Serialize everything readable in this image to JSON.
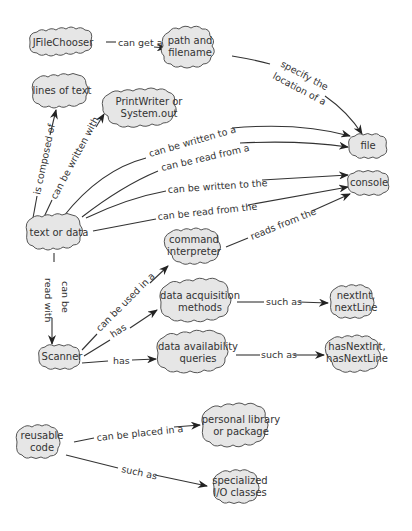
{
  "diagram": {
    "type": "concept-map",
    "colors": {
      "node_fill": "#e6e6e6",
      "node_stroke": "#555555",
      "edge": "#333333",
      "text": "#333333"
    },
    "nodes": [
      {
        "id": "jfilechooser",
        "label": "JFileChooser",
        "x": 63,
        "y": 43,
        "w": 72,
        "h": 26
      },
      {
        "id": "path",
        "label": "path and\nfilename",
        "x": 192,
        "y": 47,
        "w": 62,
        "h": 38
      },
      {
        "id": "lines",
        "label": "lines of text",
        "x": 64,
        "y": 92,
        "w": 64,
        "h": 30
      },
      {
        "id": "printwriter",
        "label": "PrintWriter or\nSystem.out",
        "x": 148,
        "y": 108,
        "w": 90,
        "h": 36
      },
      {
        "id": "file",
        "label": "file",
        "x": 169,
        "y": 146,
        "w": 40,
        "h": 22,
        "absx": 369
      },
      {
        "id": "console",
        "label": "console",
        "x": 369,
        "y": 183,
        "w": 42,
        "h": 22
      },
      {
        "id": "textdata",
        "label": "text or data",
        "x": 59,
        "y": 233,
        "w": 66,
        "h": 36
      },
      {
        "id": "command",
        "label": "command\ninterpreter",
        "x": 216,
        "y": 246,
        "w": 64,
        "h": 36
      },
      {
        "id": "acquisition",
        "label": "data acquisition\nmethods",
        "x": 233,
        "y": 302,
        "w": 88,
        "h": 44
      },
      {
        "id": "scanner",
        "label": "Scanner",
        "x": 59,
        "y": 357,
        "w": 42,
        "h": 22
      },
      {
        "id": "availability",
        "label": "data availability\nqueries",
        "x": 231,
        "y": 353,
        "w": 92,
        "h": 42
      },
      {
        "id": "nextint",
        "label": "nextInt,\nnextLine",
        "x": 358,
        "y": 302,
        "w": 56,
        "h": 36
      },
      {
        "id": "hasnextint",
        "label": "hasNextInt,\nhasNextLine",
        "x": 358,
        "y": 353,
        "w": 66,
        "h": 38
      },
      {
        "id": "reusable",
        "label": "reusable\ncode",
        "x": 44,
        "y": 442,
        "w": 56,
        "h": 36
      },
      {
        "id": "library",
        "label": "personal library\nor package",
        "x": 242,
        "y": 426,
        "w": 82,
        "h": 46
      },
      {
        "id": "specialized",
        "label": "specialized\nI/O classes",
        "x": 243,
        "y": 487,
        "w": 60,
        "h": 36
      }
    ],
    "edges": [
      {
        "from": "jfilechooser",
        "to": "path",
        "label": "can get a"
      },
      {
        "from": "path",
        "to": "file",
        "label": "specify the location of a"
      },
      {
        "from": "textdata",
        "to": "lines",
        "label": "is composed of"
      },
      {
        "from": "textdata",
        "to": "printwriter",
        "label": "can be written with"
      },
      {
        "from": "textdata",
        "to": "file",
        "label": "can be written to a"
      },
      {
        "from": "textdata",
        "to": "file",
        "label": "can be read from a"
      },
      {
        "from": "textdata",
        "to": "console",
        "label": "can be written to the"
      },
      {
        "from": "textdata",
        "to": "console",
        "label": "can be read from the"
      },
      {
        "from": "command",
        "to": "console",
        "label": "reads from the"
      },
      {
        "from": "textdata",
        "to": "scanner",
        "label": "can be read with"
      },
      {
        "from": "scanner",
        "to": "command",
        "label": "can be used in a"
      },
      {
        "from": "scanner",
        "to": "acquisition",
        "label": "has"
      },
      {
        "from": "scanner",
        "to": "availability",
        "label": "has"
      },
      {
        "from": "acquisition",
        "to": "nextint",
        "label": "such as"
      },
      {
        "from": "availability",
        "to": "hasnextint",
        "label": "such as"
      },
      {
        "from": "reusable",
        "to": "library",
        "label": "can be placed in a"
      },
      {
        "from": "reusable",
        "to": "specialized",
        "label": "such as"
      }
    ]
  },
  "labels": {
    "jfilechooser": "JFileChooser",
    "path_1": "path and",
    "path_2": "filename",
    "lines": "lines of text",
    "printwriter_1": "PrintWriter or",
    "printwriter_2": "System.out",
    "file": "file",
    "console": "console",
    "textdata": "text or data",
    "command_1": "command",
    "command_2": "interpreter",
    "acquisition_1": "data acquisition",
    "acquisition_2": "methods",
    "scanner": "Scanner",
    "availability_1": "data availability",
    "availability_2": "queries",
    "nextint_1": "nextInt,",
    "nextint_2": "nextLine",
    "hasnextint_1": "hasNextInt,",
    "hasnextint_2": "hasNextLine",
    "reusable_1": "reusable",
    "reusable_2": "code",
    "library_1": "personal library",
    "library_2": "or package",
    "specialized_1": "specialized",
    "specialized_2": "I/O classes"
  },
  "edge_labels": {
    "can_get_a": "can get a",
    "specify_1": "specify the",
    "specify_2": "location of a",
    "composed": "is composed of",
    "written_with": "can be written with",
    "written_to_a": "can be written to a",
    "read_from_a": "can be read from a",
    "written_to_the": "can be written to the",
    "read_from_the": "can be read from the",
    "reads_from_the": "reads from the",
    "can_be": "can be",
    "read_with": "read with",
    "used_in_a": "can be used in a",
    "has_1": "has",
    "has_2": "has",
    "such_as_1": "such as",
    "such_as_2": "such as",
    "placed_in_a": "can be placed in a",
    "such_as_3": "such as"
  }
}
